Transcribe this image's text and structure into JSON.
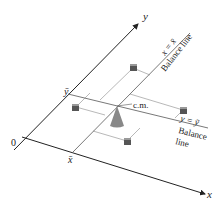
{
  "diagram": {
    "axes": {
      "x_label": "x",
      "y_label": "y",
      "origin_label": "0",
      "x_bar_label": "x̄",
      "y_bar_label": "ȳ"
    },
    "balance_lines": {
      "vertical_eq": "x = x̄",
      "vertical_label": "Balance line",
      "horizontal_eq": "y = ȳ",
      "horizontal_label_1": "Balance",
      "horizontal_label_2": "line"
    },
    "center_label": "c.m.",
    "colors": {
      "line": "#333333",
      "thin_line": "#777777",
      "cone": "#888888",
      "cube": "#555555"
    }
  }
}
